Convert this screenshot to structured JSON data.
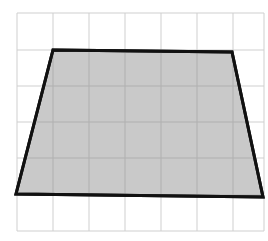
{
  "figure": {
    "type": "grid-diagram",
    "colors": {
      "background": "#ffffff",
      "grid_line": "#cfcfcf",
      "shape_fill": "#c4c4c4",
      "shape_stroke": "#111111"
    },
    "grid": {
      "columns": 7,
      "rows": 6,
      "x_lines": [
        17,
        53,
        89,
        125,
        161,
        197,
        233,
        264
      ],
      "y_lines": [
        13,
        50,
        86,
        122,
        158,
        195,
        231
      ]
    },
    "shape": {
      "name": "trapezoid",
      "vertices_grid_units": [
        [
          1,
          1
        ],
        [
          6,
          1
        ],
        [
          7,
          5
        ],
        [
          0,
          5
        ]
      ],
      "vertices_px": [
        [
          53,
          50
        ],
        [
          232,
          52
        ],
        [
          263,
          197
        ],
        [
          16,
          194
        ]
      ],
      "top_base_units": 5,
      "bottom_base_units": 7,
      "height_units": 4
    }
  }
}
